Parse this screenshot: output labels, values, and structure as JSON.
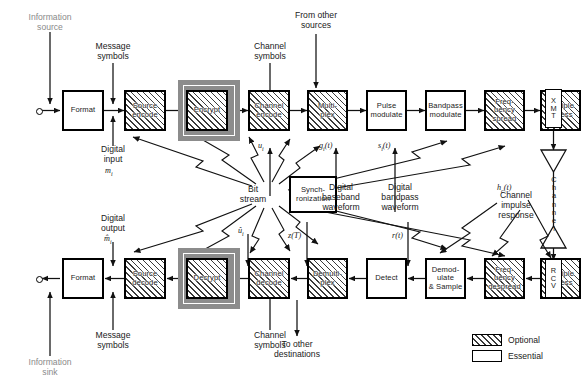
{
  "diagram": {
    "legend": {
      "optional_label": "Optional",
      "essential_label": "Essential"
    },
    "transmit_chain": [
      {
        "name": "format-tx",
        "label": "Format",
        "type": "essential"
      },
      {
        "name": "source-encode",
        "label": "Source\nencode",
        "type": "optional"
      },
      {
        "name": "encrypt",
        "label": "Encrypt",
        "type": "optional-highlighted"
      },
      {
        "name": "channel-encode",
        "label": "Channel\nencode",
        "type": "optional"
      },
      {
        "name": "multiplex",
        "label": "Multi-\nplex",
        "type": "optional"
      },
      {
        "name": "pulse-modulate",
        "label": "Pulse\nmodulate",
        "type": "essential"
      },
      {
        "name": "bandpass-modulate",
        "label": "Bandpass\nmodulate",
        "type": "essential"
      },
      {
        "name": "frequency-spread",
        "label": "Freq-\nuency\nspread",
        "type": "optional"
      },
      {
        "name": "multiple-access-tx",
        "label": "Multiple\naccess",
        "type": "optional"
      }
    ],
    "receive_chain": [
      {
        "name": "format-rx",
        "label": "Format",
        "type": "essential"
      },
      {
        "name": "source-decode",
        "label": "Source\ndecode",
        "type": "optional"
      },
      {
        "name": "decrypt",
        "label": "Decrypt",
        "type": "optional-highlighted"
      },
      {
        "name": "channel-decode",
        "label": "Channel\ndecode",
        "type": "optional"
      },
      {
        "name": "demultiplex",
        "label": "Demulti-\nplex",
        "type": "optional"
      },
      {
        "name": "detect",
        "label": "Detect",
        "type": "essential"
      },
      {
        "name": "demodulate-sample",
        "label": "Demod-\nulate\n& Sample",
        "type": "essential"
      },
      {
        "name": "frequency-despread",
        "label": "Freq-\nuency\ndespread",
        "type": "optional"
      },
      {
        "name": "multiple-access-rx",
        "label": "Multiple\naccess",
        "type": "optional"
      }
    ],
    "sync_block": {
      "label": "Synch-\nronization",
      "type": "essential"
    },
    "radio": {
      "transmitter_label": "XMT",
      "receiver_label": "RCV",
      "channel_label": "Channel"
    },
    "labels": {
      "information_source": "Information\nsource",
      "message_symbols_tx": "Message\nsymbols",
      "channel_symbols_tx": "Channel\nsymbols",
      "from_other_sources": "From other\nsources",
      "digital_input": "Digital\ninput",
      "bit_stream": "Bit\nstream",
      "digital_baseband_waveform": "Digital\nbaseband\nwaveform",
      "digital_bandpass_waveform": "Digital\nbandpass\nwaveform",
      "channel_impulse_response": "Channel\nimpulse\nresponse",
      "digital_output": "Digital\noutput",
      "message_symbols_rx": "Message\nsymbols",
      "channel_symbols_rx": "Channel\nsymbols",
      "to_other_destinations": "To other\ndestinations",
      "information_sink": "Information\nsink"
    },
    "math": {
      "m_i": "m",
      "m_i_sub": "i",
      "m_hat_i": "m̂",
      "m_hat_i_sub": "i",
      "u_i": "u",
      "u_i_sub": "i",
      "u_hat_i": "û",
      "u_hat_i_sub": "i",
      "g_i_t": "g",
      "g_i_sub": "i",
      "g_i_arg": "(t)",
      "s_i_t": "s",
      "s_i_sub": "i",
      "s_i_arg": "(t)",
      "z_T": "z(T)",
      "r_t": "r",
      "r_arg": "(t)",
      "h_c_t": "h",
      "h_c_sub": "c",
      "h_c_arg": "(t)"
    },
    "colors": {
      "ink": "#1a1a1a",
      "faint_text": "#8a8a8a",
      "highlight_frame": "#8c8c8c",
      "hatch": "#3a3a3a"
    }
  }
}
